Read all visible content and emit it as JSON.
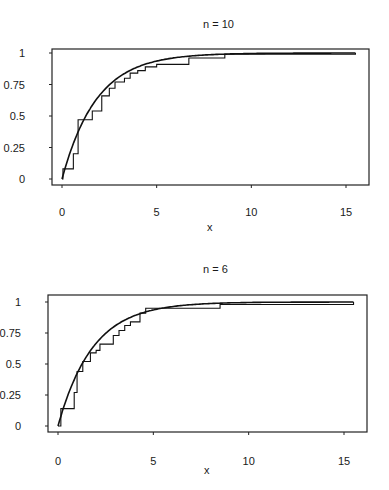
{
  "chart_data": [
    {
      "type": "line",
      "title": "n = 10",
      "xlabel": "x",
      "ylabel": "",
      "xlim": [
        0,
        15.5
      ],
      "ylim": [
        0,
        1
      ],
      "xticks": [
        "0",
        "5",
        "10",
        "15"
      ],
      "yticks": [
        "0",
        "0.25",
        "0.5",
        "0.75",
        "1"
      ],
      "grid": false,
      "legend": null,
      "series": [
        {
          "name": "theoretical CDF (smooth curve)",
          "kind": "curve",
          "rate": 0.55,
          "x": [
            0,
            1,
            2,
            3,
            4,
            5,
            6,
            7,
            8,
            10,
            12,
            15.5
          ],
          "values": [
            0,
            0.42,
            0.67,
            0.81,
            0.89,
            0.94,
            0.96,
            0.98,
            0.99,
            0.995,
            0.998,
            1.0
          ]
        },
        {
          "name": "empirical CDF (step)",
          "kind": "step",
          "x": [
            0,
            0.05,
            0.5,
            0.6,
            0.85,
            1.5,
            1.6,
            2.0,
            2.1,
            2.4,
            2.5,
            2.8,
            3.3,
            3.6,
            4.0,
            4.4,
            5.0,
            6.7,
            8.6,
            15.5
          ],
          "values": [
            0.0,
            0.08,
            0.08,
            0.2,
            0.47,
            0.47,
            0.54,
            0.54,
            0.66,
            0.66,
            0.72,
            0.77,
            0.8,
            0.84,
            0.86,
            0.89,
            0.91,
            0.96,
            0.99,
            1.0
          ]
        }
      ]
    },
    {
      "type": "line",
      "title": "n = 6",
      "xlabel": "x",
      "ylabel": "",
      "xlim": [
        0,
        15.5
      ],
      "ylim": [
        0,
        1
      ],
      "xticks": [
        "0",
        "5",
        "10",
        "15"
      ],
      "yticks": [
        "0",
        "0.25",
        "0.5",
        "0.75",
        "1"
      ],
      "grid": false,
      "legend": null,
      "series": [
        {
          "name": "theoretical CDF (smooth curve)",
          "kind": "curve",
          "rate": 0.55,
          "x": [
            0,
            1,
            2,
            3,
            4,
            5,
            6,
            7,
            8,
            10,
            12,
            15.5
          ],
          "values": [
            0,
            0.42,
            0.67,
            0.81,
            0.89,
            0.94,
            0.96,
            0.98,
            0.99,
            0.995,
            0.998,
            1.0
          ]
        },
        {
          "name": "empirical CDF (step)",
          "kind": "step",
          "x": [
            0,
            0.15,
            0.75,
            0.85,
            1.0,
            1.3,
            1.7,
            2.0,
            2.2,
            2.7,
            2.9,
            3.2,
            3.5,
            3.8,
            4.2,
            4.3,
            4.6,
            8.5,
            15.5
          ],
          "values": [
            0.0,
            0.14,
            0.14,
            0.27,
            0.44,
            0.52,
            0.59,
            0.61,
            0.66,
            0.66,
            0.73,
            0.77,
            0.81,
            0.84,
            0.84,
            0.91,
            0.95,
            0.98,
            1.0
          ]
        }
      ]
    }
  ]
}
